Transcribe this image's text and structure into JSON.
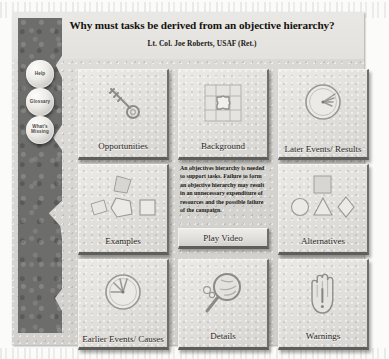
{
  "header": {
    "title": "Why must tasks be derived from an objective hierarchy?",
    "subtitle": "Lt. Col. Joe Roberts, USAF (Ret.)"
  },
  "sidebar": {
    "buttons": [
      {
        "label": "Help",
        "icon": "help-button"
      },
      {
        "label": "Glossary",
        "icon": "glossary-button"
      },
      {
        "label": "What's Missing",
        "icon": "whats-missing-button"
      }
    ]
  },
  "main": {
    "tiles": [
      {
        "label": "Opportunities",
        "icon": "key-icon"
      },
      {
        "label": "Background",
        "icon": "puzzle-icon"
      },
      {
        "label": "Later Events/ Results",
        "icon": "clock-icon"
      },
      {
        "label": "Examples",
        "icon": "polygon-shapes-icon"
      },
      {
        "label": "Alternatives",
        "icon": "geometric-shapes-icon"
      },
      {
        "label": "Earlier Events/ Causes",
        "icon": "clock-icon"
      },
      {
        "label": "Details",
        "icon": "magnifying-glass-icon"
      },
      {
        "label": "Warnings",
        "icon": "hand-icon"
      }
    ],
    "center_panel": {
      "body": "An objectives hierarchy is needed to support tasks. Failure to form an objective hierarchy may result in an unnecessary expenditure of resources and the possible failure of the campaign.",
      "play_label": "Play Video"
    }
  },
  "colors": {
    "panel_bg": "#d9d8d4",
    "tile_face": "#e2e0dc",
    "rail": "#6e6e6c",
    "text": "#2b2824",
    "page_bg": "#ffffff"
  }
}
